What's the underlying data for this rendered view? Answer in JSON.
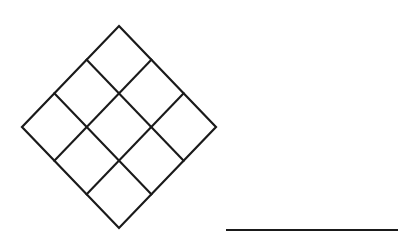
{
  "figure": {
    "name": "rotated-square-lattice-diagram",
    "background_color": "#ffffff",
    "stroke_color": "#1a1a1a",
    "canvas": {
      "width": 410,
      "height": 236
    },
    "shapes": {
      "lattice": {
        "name": "diamond-lattice",
        "description": "3 by 3 grid of squares rotated 45 degrees forming a diamond",
        "rows": 3,
        "columns": 3,
        "cell_count": 9,
        "rotation_degrees": 45,
        "stroke_width": 2,
        "vertices": {
          "top": {
            "x": 120,
            "y": 26
          },
          "left": {
            "x": 22,
            "y": 128
          },
          "right": {
            "x": 216,
            "y": 128
          },
          "bottom": {
            "x": 120,
            "y": 228
          }
        },
        "center": {
          "x": 119,
          "y": 127
        },
        "half_diagonal_x": 97,
        "half_diagonal_y": 101
      },
      "rule": {
        "name": "horizontal-rule",
        "x1": 226,
        "y1": 230,
        "x2": 398,
        "y2": 230,
        "stroke_width": 2
      }
    }
  }
}
